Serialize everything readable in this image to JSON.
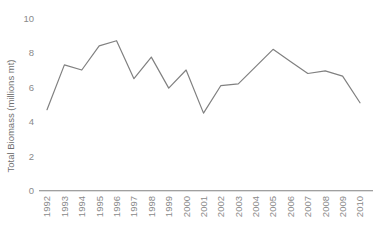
{
  "chart_data": {
    "type": "line",
    "title": "",
    "xlabel": "",
    "ylabel": "Total Biomass (millions mt)",
    "categories": [
      "1992",
      "1993",
      "1994",
      "1995",
      "1996",
      "1997",
      "1998",
      "1999",
      "2000",
      "2001",
      "2002",
      "2003",
      "2004",
      "2005",
      "2006",
      "2007",
      "2008",
      "2009",
      "2010"
    ],
    "values": [
      4.7,
      7.3,
      7.0,
      8.4,
      8.7,
      6.5,
      7.75,
      5.95,
      7.0,
      4.5,
      6.1,
      6.2,
      7.2,
      8.2,
      7.5,
      6.8,
      6.95,
      6.65,
      5.1
    ],
    "series": [
      {
        "name": "Total Biomass",
        "values": [
          4.7,
          7.3,
          7.0,
          8.4,
          8.7,
          6.5,
          7.75,
          5.95,
          7.0,
          4.5,
          6.1,
          6.2,
          7.2,
          8.2,
          7.5,
          6.8,
          6.95,
          6.65,
          5.1
        ]
      }
    ],
    "ylim": [
      0,
      10
    ],
    "yticks": [
      0,
      2,
      4,
      6,
      8,
      10
    ],
    "ytick_labels": [
      "0",
      "2",
      "4",
      "6",
      "8",
      "10"
    ],
    "grid": false,
    "legend": "none",
    "line_color": "#808080",
    "axis_color": "#808080",
    "tick_text_color": "#8a8a8a",
    "axis_title_color": "#6f6f6f",
    "background_color": "#ffffff",
    "xtick_rotation": -90
  }
}
